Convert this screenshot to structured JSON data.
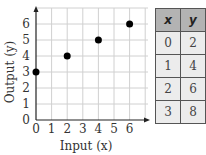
{
  "chart_data": {
    "type": "scatter",
    "title": "",
    "xlabel": "Input (x)",
    "ylabel": "Output (y)",
    "xlim": [
      0,
      7
    ],
    "ylim": [
      0,
      7
    ],
    "xticks": [
      "0",
      "1",
      "2",
      "3",
      "4",
      "5",
      "6"
    ],
    "yticks": [
      "0",
      "1",
      "2",
      "3",
      "4",
      "5",
      "6"
    ],
    "grid": true,
    "series": [
      {
        "name": "points",
        "x": [
          0,
          2,
          4,
          6
        ],
        "y": [
          3,
          4,
          5,
          6
        ]
      }
    ]
  },
  "table": {
    "headers": [
      "x",
      "y"
    ],
    "rows": [
      [
        "0",
        "2"
      ],
      [
        "1",
        "4"
      ],
      [
        "2",
        "6"
      ],
      [
        "3",
        "8"
      ]
    ]
  }
}
